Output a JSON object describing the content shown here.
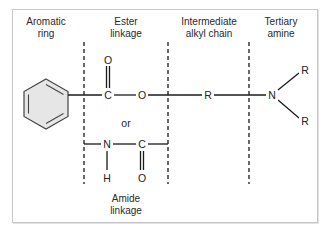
{
  "diagram": {
    "regions": [
      {
        "label": "Aromatic\nring"
      },
      {
        "label": "Ester\nlinkage"
      },
      {
        "label": "Intermediate\nalkyl chain"
      },
      {
        "label": "Tertiary\namine"
      }
    ],
    "bottom_label": "Amide\nlinkage",
    "connector": "or",
    "ester": {
      "carbonyl_o": "O",
      "carbon": "C",
      "oxygen": "O"
    },
    "amide": {
      "nitrogen": "N",
      "carbon": "C",
      "hydrogen": "H",
      "carbonyl_o": "O"
    },
    "chain": {
      "group": "R"
    },
    "amine": {
      "nitrogen": "N",
      "r_top": "R",
      "r_bottom": "R"
    },
    "colors": {
      "ring_fill": "#e6e6e6",
      "line": "#1a1a1a",
      "frame": "#c8c8c8"
    }
  }
}
